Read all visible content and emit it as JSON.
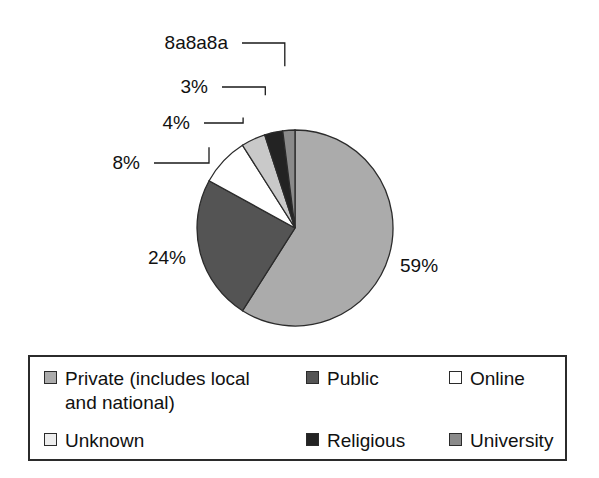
{
  "chart_data": {
    "type": "pie",
    "title": "",
    "subtitle": "",
    "xlabel": "",
    "ylabel": "",
    "grid": false,
    "legend_position": "bottom",
    "units": "percent",
    "start_angle_deg": 0,
    "direction": "clockwise",
    "categories": [
      "Private (includes local and national)",
      "Public",
      "Online",
      "Unknown",
      "Religious",
      "University"
    ],
    "values": [
      59,
      24,
      8,
      4,
      3,
      2
    ],
    "value_labels": [
      "59%",
      "24%",
      "8%",
      "4%",
      "3%",
      "2%"
    ],
    "colors": [
      "#ababab",
      "#545454",
      "#ffffff",
      "#c9c9c9",
      "#232323",
      "#8a8a8a"
    ],
    "slices": [
      {
        "label": "Private (includes local and national)",
        "value": 59,
        "display": "59%",
        "color": "#ababab",
        "leader": false
      },
      {
        "label": "Public",
        "value": 24,
        "display": "24%",
        "color": "#545454",
        "leader": false
      },
      {
        "label": "Online",
        "value": 8,
        "display": "8%",
        "color": "#ffffff",
        "leader": true
      },
      {
        "label": "Unknown",
        "value": 4,
        "display": "4%",
        "color": "#c9c9c9",
        "leader": true
      },
      {
        "label": "Religious",
        "value": 3,
        "display": "3%",
        "color": "#232323",
        "leader": true
      },
      {
        "label": "University",
        "value": 2,
        "display": "8a8a8a",
        "color": "#8a8a8a",
        "leader": true
      }
    ]
  },
  "pie": {
    "labels": {
      "private": "59%",
      "public": "24%",
      "online": "8%",
      "unknown": "4%",
      "religious": "3%",
      "university": "2%"
    }
  },
  "legend": {
    "items": [
      {
        "label": "Private (includes local\nand national)",
        "color": "#ababab",
        "name": "private"
      },
      {
        "label": "Public",
        "color": "#545454",
        "name": "public"
      },
      {
        "label": "Online",
        "color": "#ffffff",
        "name": "online"
      },
      {
        "label": "Unknown",
        "color": "#eeeeee",
        "name": "unknown"
      },
      {
        "label": "Religious",
        "color": "#232323",
        "name": "religious"
      },
      {
        "label": "University",
        "color": "#8a8a8a",
        "name": "university"
      }
    ]
  },
  "style": {
    "background": "#ffffff",
    "outline": "#2b2b2b",
    "text": "#111111"
  }
}
